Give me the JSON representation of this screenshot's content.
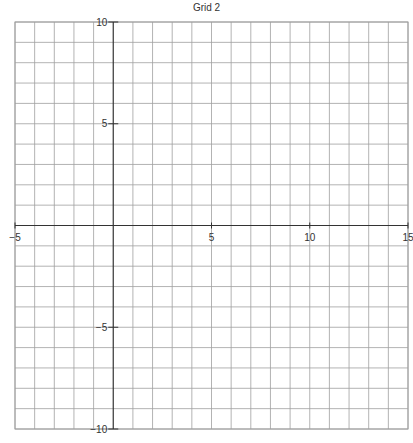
{
  "title": "Grid 2",
  "chart_data": {
    "type": "grid",
    "title": "Grid 2",
    "xlim": [
      -5,
      15
    ],
    "ylim": [
      -10,
      10
    ],
    "grid_step_x": 1,
    "grid_step_y": 1,
    "x_ticks": [
      -5,
      5,
      10,
      15
    ],
    "y_ticks": [
      10,
      5,
      -5,
      -10
    ],
    "grid": true,
    "colors": {
      "grid": "#a0a0a0",
      "axis": "#333333"
    }
  }
}
